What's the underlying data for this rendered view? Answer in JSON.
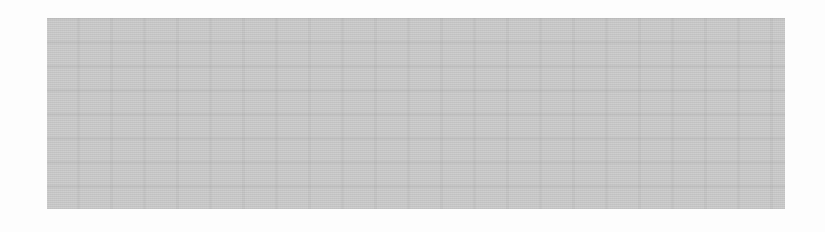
{
  "image": {
    "description": "Scanned halftone gray rectangle on white background; no legible text",
    "background_color": "#fdfdfd",
    "block": {
      "color": "#cbcbcb",
      "x": 47,
      "y": 18,
      "width": 738,
      "height": 191
    }
  }
}
